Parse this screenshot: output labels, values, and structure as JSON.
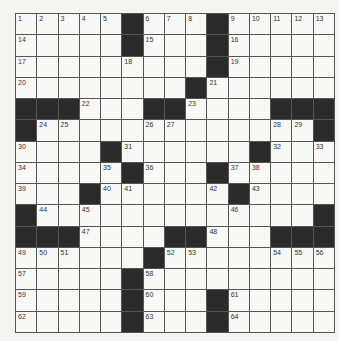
{
  "puzzle": {
    "rows": 15,
    "cols": 15,
    "layout": [
      ".....#...#.....",
      ".....#...#.....",
      ".........#.....",
      "........#......",
      "###...##....###",
      "#.............#",
      "....#......#...",
      ".....#...#.....",
      "...#......#....",
      "#.............#",
      "###....##...###",
      "......#........",
      ".....#.........",
      ".....#...#.....",
      ".....#...#....."
    ],
    "numbers": [
      {
        "r": 0,
        "c": 0,
        "n": 1
      },
      {
        "r": 0,
        "c": 1,
        "n": 2
      },
      {
        "r": 0,
        "c": 2,
        "n": 3
      },
      {
        "r": 0,
        "c": 3,
        "n": 4
      },
      {
        "r": 0,
        "c": 4,
        "n": 5
      },
      {
        "r": 0,
        "c": 6,
        "n": 6
      },
      {
        "r": 0,
        "c": 7,
        "n": 7
      },
      {
        "r": 0,
        "c": 8,
        "n": 8
      },
      {
        "r": 0,
        "c": 10,
        "n": 9
      },
      {
        "r": 0,
        "c": 11,
        "n": 10
      },
      {
        "r": 0,
        "c": 12,
        "n": 11
      },
      {
        "r": 0,
        "c": 13,
        "n": 12
      },
      {
        "r": 0,
        "c": 14,
        "n": 13
      },
      {
        "r": 1,
        "c": 0,
        "n": 14
      },
      {
        "r": 1,
        "c": 6,
        "n": 15
      },
      {
        "r": 1,
        "c": 10,
        "n": 16
      },
      {
        "r": 2,
        "c": 0,
        "n": 17
      },
      {
        "r": 2,
        "c": 5,
        "n": 18
      },
      {
        "r": 2,
        "c": 10,
        "n": 19
      },
      {
        "r": 3,
        "c": 0,
        "n": 20
      },
      {
        "r": 3,
        "c": 9,
        "n": 21
      },
      {
        "r": 4,
        "c": 3,
        "n": 22
      },
      {
        "r": 4,
        "c": 8,
        "n": 23
      },
      {
        "r": 5,
        "c": 1,
        "n": 24
      },
      {
        "r": 5,
        "c": 2,
        "n": 25
      },
      {
        "r": 5,
        "c": 6,
        "n": 26
      },
      {
        "r": 5,
        "c": 7,
        "n": 27
      },
      {
        "r": 5,
        "c": 12,
        "n": 28
      },
      {
        "r": 5,
        "c": 13,
        "n": 29
      },
      {
        "r": 6,
        "c": 0,
        "n": 30
      },
      {
        "r": 6,
        "c": 5,
        "n": 31
      },
      {
        "r": 6,
        "c": 12,
        "n": 32
      },
      {
        "r": 6,
        "c": 14,
        "n": 33
      },
      {
        "r": 7,
        "c": 0,
        "n": 34
      },
      {
        "r": 7,
        "c": 4,
        "n": 35
      },
      {
        "r": 7,
        "c": 6,
        "n": 36
      },
      {
        "r": 7,
        "c": 10,
        "n": 37
      },
      {
        "r": 7,
        "c": 11,
        "n": 38
      },
      {
        "r": 8,
        "c": 0,
        "n": 39
      },
      {
        "r": 8,
        "c": 4,
        "n": 40
      },
      {
        "r": 8,
        "c": 5,
        "n": 41
      },
      {
        "r": 8,
        "c": 9,
        "n": 42
      },
      {
        "r": 8,
        "c": 11,
        "n": 43
      },
      {
        "r": 9,
        "c": 1,
        "n": 44
      },
      {
        "r": 9,
        "c": 3,
        "n": 45
      },
      {
        "r": 9,
        "c": 10,
        "n": 46
      },
      {
        "r": 10,
        "c": 3,
        "n": 47
      },
      {
        "r": 10,
        "c": 9,
        "n": 48
      },
      {
        "r": 11,
        "c": 0,
        "n": 49
      },
      {
        "r": 11,
        "c": 1,
        "n": 50
      },
      {
        "r": 11,
        "c": 2,
        "n": 51
      },
      {
        "r": 11,
        "c": 7,
        "n": 52
      },
      {
        "r": 11,
        "c": 8,
        "n": 53
      },
      {
        "r": 11,
        "c": 12,
        "n": 54
      },
      {
        "r": 11,
        "c": 13,
        "n": 55
      },
      {
        "r": 11,
        "c": 14,
        "n": 56
      },
      {
        "r": 12,
        "c": 0,
        "n": 57
      },
      {
        "r": 12,
        "c": 6,
        "n": 58
      },
      {
        "r": 13,
        "c": 0,
        "n": 59
      },
      {
        "r": 13,
        "c": 6,
        "n": 60
      },
      {
        "r": 13,
        "c": 10,
        "n": 61
      },
      {
        "r": 14,
        "c": 0,
        "n": 62
      },
      {
        "r": 14,
        "c": 6,
        "n": 63
      },
      {
        "r": 14,
        "c": 10,
        "n": 64
      }
    ],
    "colors": {
      "black_cell": "#2b2b2b",
      "white_cell": "#f8f8f6",
      "grid_line": "#555555",
      "background": "#f4f4f2"
    }
  }
}
